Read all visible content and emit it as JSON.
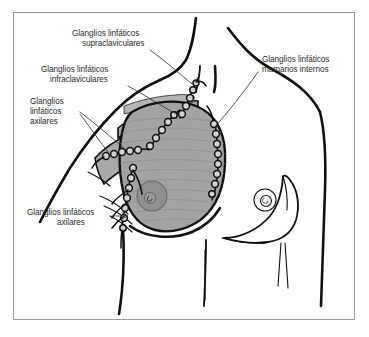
{
  "figure": {
    "frame_border_color": "#9a9a9a",
    "background_color": "#ffffff",
    "line_color": "#111111",
    "tissue_fill_color": "#a3a3a3",
    "areola_fill_color": "#8f8f8f",
    "node_fill_color": "#d2d2d2",
    "text_color": "#2a2a2a"
  },
  "labels": {
    "supraclavicular": {
      "line1": "Glanglios linfáticos",
      "line2": "supraclaviculares"
    },
    "infraclavicular": {
      "line1": "Glanglios linfáticos",
      "line2": "infraclaviculares"
    },
    "axillary_upper": {
      "line1": "Glanglios",
      "line2": "linfáticos",
      "line3": "axilares"
    },
    "internal_mammary": {
      "line1": "Glanglios linfáticos",
      "line2": "mamarios internos"
    },
    "axillary_lower": {
      "line1": "Glanglios linfáticos",
      "line2": "axilares"
    }
  },
  "anatomy": {
    "left_breast_name": "mama-izquierda-con-tejido",
    "right_breast_name": "mama-derecha-contorno",
    "node_chain_names": [
      "cadena-supraclavicular",
      "cadena-infraclavicular",
      "cadena-axilar-superior",
      "cadena-axilar-inferior",
      "cadena-mamaria-interna"
    ]
  }
}
